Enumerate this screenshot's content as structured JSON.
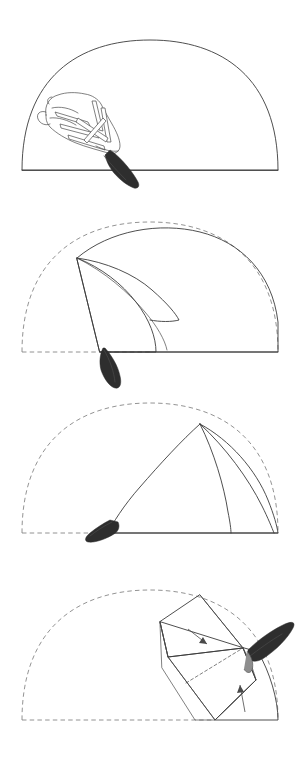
{
  "document": {
    "title": "Folding sequence illustration",
    "background_color": "#ffffff",
    "width": 301,
    "height": 761,
    "medium": "pen-and-ink stipple line drawing",
    "panel_count": 4
  },
  "style": {
    "ink_color": "#3b3b3b",
    "dashed_guide_color": "#777777",
    "stipple_color": "#9aa0a6",
    "dark_fill_color": "#2e2e2e",
    "mid_fill_color": "#8d8d8d",
    "paper_color": "#ffffff"
  },
  "panels": [
    {
      "index": 1,
      "name": "panel-unfolded-with-figure",
      "description": "Full semicircular dome outline, lightly stippled, with a skeletal fish figure drawn at lower left crossing the baseline",
      "has_dashed_guide": false,
      "has_arrows": false,
      "figure_visible": true,
      "baseline_y": 170,
      "dome_left_x": 22,
      "dome_right_x": 278,
      "dome_apex_y": 40
    },
    {
      "index": 2,
      "name": "panel-first-fold",
      "description": "Left portion folded over toward the right forming a curved triangular flap; original outline shown as dashed arc on the left",
      "has_dashed_guide": true,
      "has_arrows": false,
      "figure_visible": false,
      "baseline_y": 352,
      "dome_left_x": 22,
      "dome_right_x": 278,
      "dome_apex_y": 222
    },
    {
      "index": 3,
      "name": "panel-second-fold",
      "description": "Form folded further to the right into a tall cone with two visible fold seams; dashed arc marks the original semicircle",
      "has_dashed_guide": true,
      "has_arrows": false,
      "figure_visible": false,
      "baseline_y": 533,
      "dome_left_x": 22,
      "dome_right_x": 278,
      "dome_apex_y": 403
    },
    {
      "index": 4,
      "name": "panel-final-fold",
      "description": "Compact folded bundle at the right with two directional arrows indicating the closing folds; dashed arc marks the original semicircle",
      "has_dashed_guide": true,
      "has_arrows": true,
      "arrow_count": 2,
      "figure_visible": false,
      "baseline_y": 720,
      "dome_left_x": 22,
      "dome_right_x": 278,
      "dome_apex_y": 590
    }
  ],
  "annotations": {
    "arrows": [
      {
        "name": "fold-arrow-upper",
        "direction": "down-right",
        "panel": 4
      },
      {
        "name": "fold-arrow-lower",
        "direction": "up-right",
        "panel": 4
      }
    ]
  },
  "figure_detail": {
    "name": "skeletal-fish-motif",
    "description": "Stippled elongated body with white bone-like struts and a dark tapered tail extending below the baseline",
    "panel": 1
  },
  "tails": [
    {
      "panel": 1,
      "name": "tail-tip-1",
      "tone": "dark"
    },
    {
      "panel": 2,
      "name": "tail-tip-2",
      "tone": "dark"
    },
    {
      "panel": 3,
      "name": "tail-tip-3",
      "tone": "dark"
    },
    {
      "panel": 4,
      "name": "tail-tip-4",
      "tone": "dark"
    }
  ]
}
